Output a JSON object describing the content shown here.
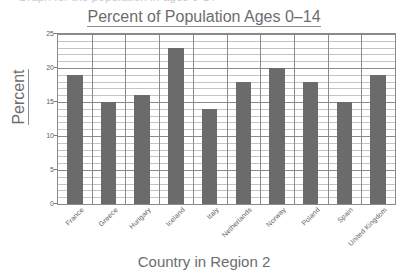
{
  "top_sliver": {
    "text": "Graph for the population in ages 0-14"
  },
  "chart_data": {
    "type": "bar",
    "title": "Percent of Population Ages 0–14",
    "xlabel": "Country in Region 2",
    "ylabel": "Percent",
    "categories": [
      "France",
      "Greece",
      "Hungary",
      "Iceland",
      "Italy",
      "Netherlands",
      "Norway",
      "Poland",
      "Spain",
      "United Kingdom"
    ],
    "values": [
      19,
      15,
      16,
      23,
      14,
      18,
      20,
      18,
      15,
      19
    ],
    "ylim": [
      0,
      25
    ],
    "ytick_labels": [
      "0",
      "5",
      "10",
      "15",
      "20",
      "25"
    ],
    "ytick_values": [
      0,
      5,
      10,
      15,
      20,
      25
    ],
    "minor_tick_step": 1,
    "grid": "both",
    "legend": "none",
    "bar_color": "#6b6b6b",
    "grid_color": "#c4c4c4",
    "axis_color": "#8a8a8a",
    "text_color": "#6d6d6d"
  }
}
